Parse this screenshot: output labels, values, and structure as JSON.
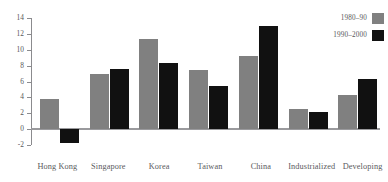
{
  "chart_data": {
    "type": "bar",
    "title": "",
    "xlabel": "",
    "ylabel": "",
    "ylim": [
      -2,
      14
    ],
    "yticks": [
      "14",
      "12",
      "10",
      "8",
      "6",
      "4",
      "2",
      "0",
      "-2"
    ],
    "ytick_values": [
      14,
      12,
      10,
      8,
      6,
      4,
      2,
      0,
      -2
    ],
    "grid": false,
    "legend_position": "top-right",
    "categories": [
      "Hong Kong",
      "Singapore",
      "Korea",
      "Taiwan",
      "China",
      "Industrialized",
      "Developing"
    ],
    "series": [
      {
        "name": "1980–90",
        "color": "#808080",
        "values": [
          3.8,
          7.0,
          11.3,
          7.4,
          9.2,
          2.5,
          4.3
        ]
      },
      {
        "name": "1990–2000",
        "color": "#111111",
        "values": [
          -1.7,
          7.6,
          8.3,
          5.4,
          13.0,
          2.1,
          6.3
        ]
      }
    ]
  },
  "legend": {
    "items": [
      {
        "label": "1980–90",
        "color": "#808080"
      },
      {
        "label": "1990–2000",
        "color": "#111111"
      }
    ]
  },
  "colors": {
    "series_1980_90": "#808080",
    "series_1990_2000": "#111111",
    "axis": "#8b8b8e",
    "text": "#57575a",
    "background": "#ffffff"
  }
}
